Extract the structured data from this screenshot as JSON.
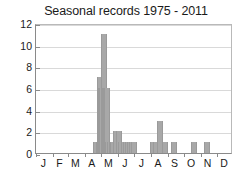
{
  "chart_data": {
    "type": "bar",
    "title": "Seasonal records 1975 - 2011",
    "xlabel": "",
    "ylabel": "",
    "grid": true,
    "legend": false,
    "ylim": [
      0,
      12
    ],
    "ytick_labels": [
      "0",
      "2",
      "4",
      "6",
      "8",
      "10",
      "12"
    ],
    "ytick_values": [
      0,
      2,
      4,
      6,
      8,
      10,
      12
    ],
    "xtick_labels": [
      "J",
      "F",
      "M",
      "A",
      "M",
      "J",
      "J",
      "A",
      "S",
      "O",
      "N",
      "D"
    ],
    "xtick_months": [
      "January",
      "February",
      "March",
      "April",
      "May",
      "June",
      "July",
      "August",
      "September",
      "October",
      "November",
      "December"
    ],
    "bar_color": "#a8a8a8",
    "x_unit": "day-of-year bin",
    "x_range_days": [
      1,
      365
    ],
    "categories": [
      "Apr 20",
      "Apr 25",
      "Apr 28",
      "Apr 30",
      "May 2",
      "May 4",
      "May 6",
      "May 8",
      "May 10",
      "May 12",
      "May 14",
      "May 16",
      "May 18",
      "May 22",
      "May 26",
      "May 30",
      "Jun 3",
      "Jun 7",
      "Jun 11",
      "Jun 15",
      "Jun 19",
      "Jun 23",
      "Aug 3",
      "Aug 7",
      "Aug 14",
      "Aug 21",
      "Sep 4",
      "Oct 12",
      "Nov 5"
    ],
    "values": [
      1,
      1,
      7,
      6,
      6,
      11,
      6,
      6,
      6,
      1,
      1,
      1,
      1,
      2,
      2,
      1,
      1,
      1,
      1,
      1,
      1,
      1,
      1,
      1,
      3,
      1,
      1,
      1,
      1
    ],
    "bars": [
      {
        "day": 110,
        "value": 1
      },
      {
        "day": 115,
        "value": 1
      },
      {
        "day": 118,
        "value": 7
      },
      {
        "day": 120,
        "value": 6
      },
      {
        "day": 122,
        "value": 6
      },
      {
        "day": 124,
        "value": 11
      },
      {
        "day": 126,
        "value": 6
      },
      {
        "day": 128,
        "value": 6
      },
      {
        "day": 130,
        "value": 6
      },
      {
        "day": 133,
        "value": 1
      },
      {
        "day": 136,
        "value": 1
      },
      {
        "day": 139,
        "value": 1
      },
      {
        "day": 142,
        "value": 1
      },
      {
        "day": 147,
        "value": 2
      },
      {
        "day": 152,
        "value": 2
      },
      {
        "day": 157,
        "value": 1
      },
      {
        "day": 161,
        "value": 1
      },
      {
        "day": 165,
        "value": 1
      },
      {
        "day": 169,
        "value": 1
      },
      {
        "day": 173,
        "value": 1
      },
      {
        "day": 177,
        "value": 1
      },
      {
        "day": 181,
        "value": 1
      },
      {
        "day": 215,
        "value": 1
      },
      {
        "day": 220,
        "value": 1
      },
      {
        "day": 228,
        "value": 3
      },
      {
        "day": 237,
        "value": 1
      },
      {
        "day": 255,
        "value": 1
      },
      {
        "day": 291,
        "value": 1
      },
      {
        "day": 315,
        "value": 1
      }
    ]
  }
}
